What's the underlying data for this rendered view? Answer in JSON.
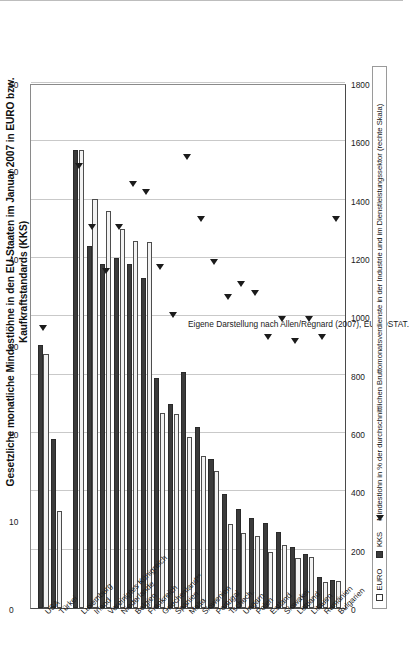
{
  "chart_data": {
    "type": "bar",
    "title": "Gesetzliche monatliche Mindestlöhne in den EU-Staaten im Januar 2007 in EURO bzw. Kaufkraftstandards (KKS) und in % der Durchschnittsverdienste in Industrie und Dienstleistungen",
    "orientation": "horizontal-rotated",
    "xlabel": "",
    "ylabel": "",
    "grid": true,
    "legend_position": "bottom-left",
    "categories": [
      "USA",
      "Türkei",
      "Luxemburg",
      "Irland",
      "Vereinigtes Königreich",
      "Niederlande",
      "Belgien",
      "Frankreich",
      "Griechenland**",
      "Spanien",
      "Malta",
      "Slowenien",
      "Portugal",
      "Tschech.",
      "Ungarn",
      "Polen",
      "Estland",
      "Slowakei",
      "Lettland",
      "Litauen",
      "Rumänien",
      "Bulgarien"
    ],
    "primary_axis": {
      "label": "EURO / KKS",
      "min": 0,
      "max": 1800,
      "ticks": [
        0,
        200,
        400,
        600,
        800,
        1000,
        1200,
        1400,
        1600,
        1800
      ]
    },
    "secondary_axis": {
      "label": "Mindestlohn in %",
      "min": 0,
      "max": 60,
      "ticks": [
        0,
        10,
        20,
        30,
        40,
        50,
        60
      ]
    },
    "series": [
      {
        "name": "KKS",
        "axis": "primary",
        "color": "#3b3b3b",
        "values": [
          900,
          578,
          1570,
          1240,
          1180,
          1200,
          1180,
          1130,
          790,
          700,
          810,
          620,
          510,
          390,
          340,
          310,
          290,
          260,
          210,
          185,
          105,
          95
        ]
      },
      {
        "name": "EURO",
        "axis": "primary",
        "color": "#f2f2f2",
        "values": [
          870,
          331,
          1570,
          1403,
          1361,
          1301,
          1259,
          1254,
          668,
          666,
          585,
          522,
          470,
          288,
          258,
          246,
          192,
          217,
          172,
          174,
          90,
          92
        ]
      },
      {
        "name": "Mindestlohn in % der durchschnittlichen Bruttomonatsverdienste",
        "axis": "secondary",
        "type": "marker",
        "color": "#1b1b1b",
        "values": [
          32,
          null,
          50.5,
          43.5,
          38.5,
          43.5,
          48.5,
          47.5,
          39,
          33.5,
          51.5,
          44.5,
          39.5,
          35.5,
          37,
          36,
          31,
          33,
          30.5,
          33,
          31,
          44.5
        ]
      }
    ]
  },
  "figure": {
    "title": "Gesetzliche monatliche Mindestlöhne in den EU-Staaten im Januar 2007 in EURO bzw. Kaufkraftstandards (KKS)\nund in % der Durchschnittsverdienste in Industrie und Dienstleistungen",
    "title_line1": "Gesetzliche monatliche Mindestlöhne in den EU-Staaten im Januar 2007 in EURO bzw. Kaufkraftstandards (KKS)",
    "title_line2": "und in % der Durchschnittsverdienste in Industrie und Dienstleistungen",
    "source_note": "Eigene Darstellung nach Allen/Regnard (2007), EUROSTAT."
  },
  "legend": {
    "items": [
      {
        "label": "EURO",
        "marker": "open-square-icon"
      },
      {
        "label": "KKS",
        "marker": "filled-square-icon"
      },
      {
        "label": "Mindestlohn in % der durchschnittlichen Bruttomonatsverdienste in der Industrie und im Dienstleistungssektor (rechte Skala)",
        "marker": "triangle-marker-icon"
      }
    ]
  }
}
